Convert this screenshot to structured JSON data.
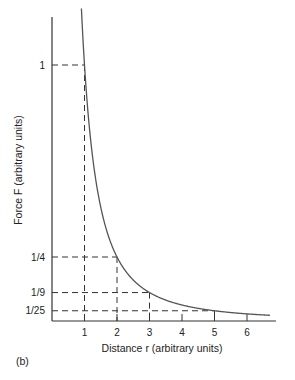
{
  "chart_data": {
    "type": "line",
    "title": "",
    "panel_label": "(b)",
    "xlabel": "Distance r (arbitrary units)",
    "ylabel": "Force F (arbitrary units)",
    "x_ticks": [
      1,
      2,
      3,
      4,
      5,
      6
    ],
    "y_ticks": [
      {
        "label": "1",
        "value": 1
      },
      {
        "label": "1/4",
        "value": 0.25
      },
      {
        "label": "1/9",
        "value": 0.1111
      },
      {
        "label": "1/25",
        "value": 0.04
      }
    ],
    "xlim": [
      0,
      6.9
    ],
    "ylim": [
      0,
      1.18
    ],
    "grid": false,
    "legend": null,
    "series": [
      {
        "name": "F = 1/r^2",
        "color": "#555555",
        "x": [
          0.9,
          1,
          1.25,
          1.5,
          2,
          2.5,
          3,
          3.5,
          4,
          5,
          6,
          6.7
        ],
        "values": [
          1.235,
          1,
          0.64,
          0.444,
          0.25,
          0.16,
          0.111,
          0.082,
          0.0625,
          0.04,
          0.028,
          0.022
        ]
      }
    ],
    "reference_lines": [
      {
        "x": 1,
        "y": 1
      },
      {
        "x": 2,
        "y": 0.25
      },
      {
        "x": 3,
        "y": 0.1111
      },
      {
        "x": 5,
        "y": 0.04
      }
    ]
  },
  "colors": {
    "axis": "#333333",
    "curve": "#555555",
    "dash": "#333333"
  }
}
